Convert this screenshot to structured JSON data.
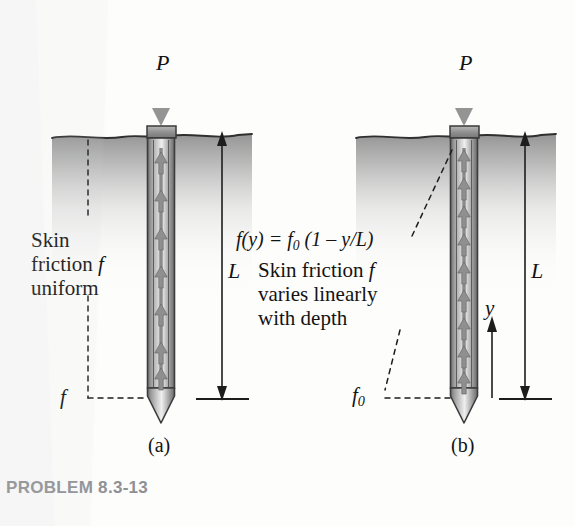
{
  "figure": {
    "caption": "PROBLEM 8.3-13",
    "background_color": "#fdfdfc",
    "ink_color": "#1b1b1b",
    "soil_color": "#9a9a9a",
    "pile_color": "#8d8d8d",
    "load_arrow_color": "#949494",
    "caption_color": "#8e9094"
  },
  "panels": [
    {
      "id": "a",
      "label": "(a)",
      "load_label": "P",
      "length_label": "L",
      "friction_label": "f",
      "notes": [
        "Skin",
        "friction f",
        "uniform"
      ],
      "note_text": "Skin friction f uniform",
      "friction_profile": "uniform"
    },
    {
      "id": "b",
      "label": "(b)",
      "load_label": "P",
      "length_label": "L",
      "depth_label": "y",
      "friction_label": "f",
      "friction_label_sub": "0",
      "formula": "f(y) = f0 (1 – y/L)",
      "formula_parts": {
        "lhs": "f(y) = f",
        "lhs_sub": "0",
        "rhs": " (1 – y/L)"
      },
      "notes": [
        "Skin friction f",
        "varies linearly",
        "with depth"
      ],
      "note_text": "Skin friction f varies linearly with depth",
      "friction_profile": "linear"
    }
  ]
}
